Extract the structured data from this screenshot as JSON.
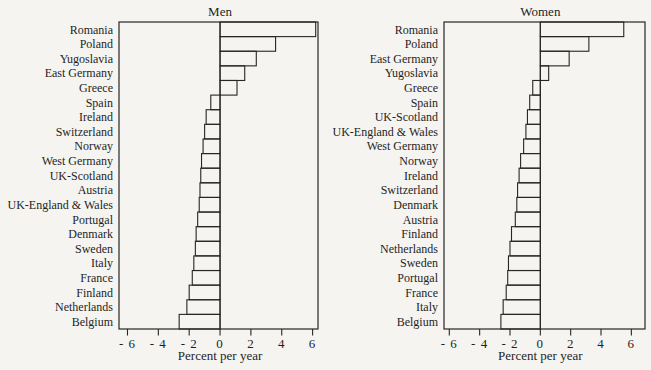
{
  "figure": {
    "background": "#f5f4f1",
    "ink": "#262626",
    "bar_fill": "none"
  },
  "chart_data": [
    {
      "type": "bar",
      "orientation": "horizontal",
      "title": "Men",
      "xlabel": "Percent per year",
      "xlim": [
        -6.55,
        6.35
      ],
      "xticks": [
        -6,
        -4,
        -2,
        0,
        2,
        4,
        6
      ],
      "xtick_labels": [
        "- 6",
        "- 4",
        "- 2",
        "0",
        "2",
        "4",
        "6"
      ],
      "grid": false,
      "legend": "none",
      "categories": [
        "Romania",
        "Poland",
        "Yugoslavia",
        "East Germany",
        "Greece",
        "Spain",
        "Ireland",
        "Switzerland",
        "Norway",
        "West Germany",
        "UK-Scotland",
        "Austria",
        "UK-England & Wales",
        "Portugal",
        "Denmark",
        "Sweden",
        "Italy",
        "France",
        "Finland",
        "Netherlands",
        "Belgium"
      ],
      "values": [
        6.2,
        3.6,
        2.35,
        1.6,
        1.1,
        -0.6,
        -0.9,
        -1.0,
        -1.1,
        -1.2,
        -1.25,
        -1.3,
        -1.35,
        -1.45,
        -1.55,
        -1.6,
        -1.7,
        -1.8,
        -2.0,
        -2.15,
        -2.65
      ]
    },
    {
      "type": "bar",
      "orientation": "horizontal",
      "title": "Women",
      "xlabel": "Percent per year",
      "xlim": [
        -6.35,
        6.9
      ],
      "xticks": [
        -6,
        -4,
        -2,
        0,
        2,
        4,
        6
      ],
      "xtick_labels": [
        "- 6",
        "- 4",
        "- 2",
        "0",
        "2",
        "4",
        "6"
      ],
      "grid": false,
      "legend": "none",
      "categories": [
        "Romania",
        "Poland",
        "East Germany",
        "Yugoslavia",
        "Greece",
        "Spain",
        "UK-Scotland",
        "UK-England & Wales",
        "West Germany",
        "Norway",
        "Ireland",
        "Switzerland",
        "Denmark",
        "Austria",
        "Finland",
        "Netherlands",
        "Sweden",
        "Portugal",
        "France",
        "Italy",
        "Belgium"
      ],
      "values": [
        5.5,
        3.2,
        1.9,
        0.55,
        -0.5,
        -0.7,
        -0.85,
        -0.95,
        -1.1,
        -1.3,
        -1.4,
        -1.5,
        -1.55,
        -1.65,
        -1.9,
        -2.0,
        -2.1,
        -2.15,
        -2.25,
        -2.45,
        -2.6
      ]
    }
  ]
}
